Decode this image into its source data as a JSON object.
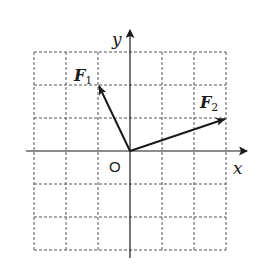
{
  "diagram": {
    "type": "vector-grid",
    "grid": {
      "x_min": -3,
      "x_max": 3,
      "y_min": -3,
      "y_max": 3,
      "cell_px": 32.7,
      "style": "dashed"
    },
    "axes": {
      "x_label": "x",
      "y_label": "y",
      "origin_label": "O"
    },
    "vectors": [
      {
        "name": "F",
        "subscript": "1",
        "from": [
          0,
          0
        ],
        "to": [
          -1,
          2
        ]
      },
      {
        "name": "F",
        "subscript": "2",
        "from": [
          0,
          0
        ],
        "to": [
          3,
          1
        ]
      }
    ],
    "colors": {
      "line": "#1a1a1a",
      "grid": "#555555",
      "background": "#ffffff"
    }
  }
}
